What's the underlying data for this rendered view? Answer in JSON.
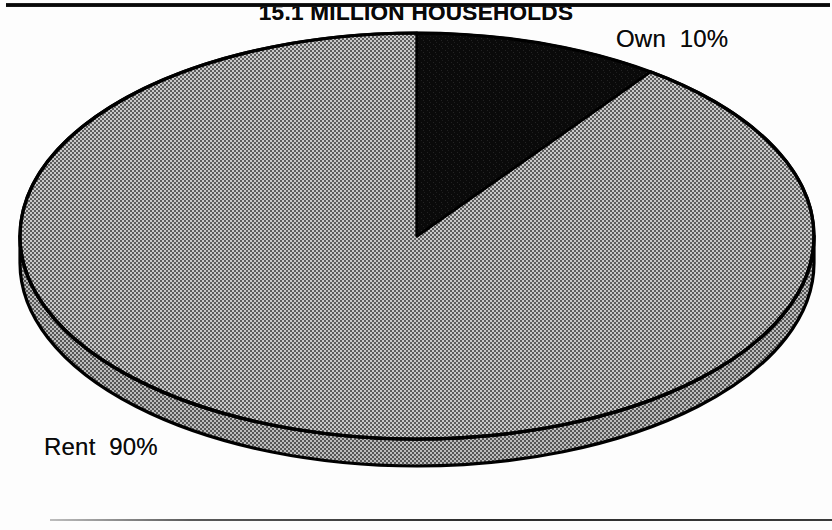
{
  "page": {
    "background_color": "#fdfdfd",
    "rules": {
      "top_color": "#000000",
      "bottom_color": "#2c2c2c"
    }
  },
  "chart_data": {
    "type": "pie",
    "title": "15.1 MILLION HOUSEHOLDS",
    "subtitle": "",
    "xlabel": "",
    "ylabel": "",
    "style": "3d-pie",
    "total_label": "15.1 MILLION HOUSEHOLDS",
    "total_value": 15.1,
    "total_units": "million households",
    "start_angle_deg": 0,
    "direction": "clockwise",
    "legend": "none",
    "grid": false,
    "categories": [
      "Own",
      "Rent"
    ],
    "values": [
      10,
      90
    ],
    "value_units": "percent",
    "slices": [
      {
        "name": "Own",
        "label": "Own  10%",
        "value": 10,
        "percent": "10%",
        "color": "#0d0d0d",
        "fill_style": "solid-black",
        "start_angle_deg": 0,
        "end_angle_deg": 36
      },
      {
        "name": "Rent",
        "label": "Rent  90%",
        "value": 90,
        "percent": "90%",
        "color": "#9c9c9c",
        "fill_style": "halftone-gray",
        "start_angle_deg": 36,
        "end_angle_deg": 360
      }
    ],
    "annotations": [
      {
        "name": "own-callout",
        "text": "Own  10%",
        "position": "top-right"
      },
      {
        "name": "rent-callout",
        "text": "Rent  90%",
        "position": "bottom-left"
      }
    ]
  },
  "labels": {
    "own": "Own  10%",
    "rent": "Rent  90%",
    "caption": "15.1 MILLION HOUSEHOLDS"
  },
  "geometry": {
    "center_x": 417,
    "center_y": 236,
    "radius_x": 397,
    "radius_y": 203,
    "depth": 27,
    "outline_color": "#000000"
  }
}
